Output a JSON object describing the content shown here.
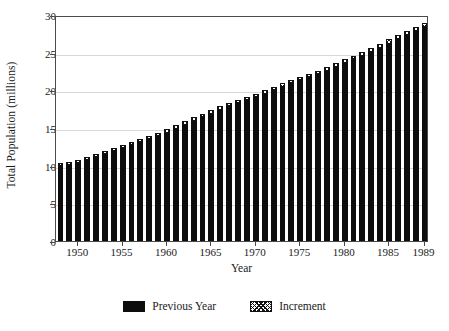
{
  "chart_data": {
    "type": "bar",
    "title": "",
    "subtitle": "",
    "xlabel": "Year",
    "ylabel": "Total Population (millions)",
    "xlim": [
      1947.5,
      1989.5
    ],
    "ylim": [
      0,
      30
    ],
    "yticks": [
      0,
      5,
      10,
      15,
      20,
      25,
      30
    ],
    "ytick_labels": [
      "0",
      "5",
      "10",
      "15",
      "20",
      "25",
      "30"
    ],
    "xticks": [
      1950,
      1955,
      1960,
      1965,
      1970,
      1975,
      1980,
      1985,
      1989
    ],
    "xtick_labels": [
      "1950",
      "1955",
      "1960",
      "1965",
      "1970",
      "1975",
      "1980",
      "1985",
      "1989"
    ],
    "grid": true,
    "grid_axis": "y",
    "stacked": true,
    "legend_position": "bottom",
    "legend": [
      "Previous Year",
      "Increment"
    ],
    "colors": {
      "previous_year": "#0d0d0d",
      "increment": "#ffffff",
      "increment_edge": "#111111",
      "grid": "#d8d8d8",
      "frame": "#4a4a4a",
      "background": "#ffffff"
    },
    "categories": [
      1948,
      1949,
      1950,
      1951,
      1952,
      1953,
      1954,
      1955,
      1956,
      1957,
      1958,
      1959,
      1960,
      1961,
      1962,
      1963,
      1964,
      1965,
      1966,
      1967,
      1968,
      1969,
      1970,
      1971,
      1972,
      1973,
      1974,
      1975,
      1976,
      1977,
      1978,
      1979,
      1980,
      1981,
      1982,
      1983,
      1984,
      1985,
      1986,
      1987,
      1988,
      1989
    ],
    "series": [
      {
        "name": "Previous Year",
        "values": [
          9.9,
          10.1,
          10.4,
          10.7,
          11.1,
          11.5,
          11.9,
          12.3,
          12.7,
          13.1,
          13.5,
          13.9,
          14.4,
          14.9,
          15.4,
          15.9,
          16.4,
          16.9,
          17.4,
          17.9,
          18.3,
          18.7,
          19.1,
          19.5,
          20.0,
          20.5,
          21.0,
          21.4,
          21.8,
          22.2,
          22.6,
          23.1,
          23.6,
          24.1,
          24.6,
          25.1,
          25.6,
          26.2,
          26.8,
          27.3,
          27.9,
          28.4
        ]
      },
      {
        "name": "Increment",
        "values": [
          0.2,
          0.3,
          0.3,
          0.4,
          0.4,
          0.4,
          0.4,
          0.4,
          0.4,
          0.4,
          0.4,
          0.5,
          0.5,
          0.5,
          0.5,
          0.5,
          0.5,
          0.5,
          0.5,
          0.4,
          0.4,
          0.4,
          0.4,
          0.5,
          0.5,
          0.5,
          0.4,
          0.4,
          0.4,
          0.4,
          0.5,
          0.5,
          0.5,
          0.5,
          0.5,
          0.5,
          0.6,
          0.6,
          0.5,
          0.6,
          0.5,
          0.6
        ]
      }
    ],
    "totals": [
      10.1,
      10.4,
      10.7,
      11.1,
      11.5,
      11.9,
      12.3,
      12.7,
      13.1,
      13.5,
      13.9,
      14.4,
      14.9,
      15.4,
      15.9,
      16.4,
      16.9,
      17.4,
      17.9,
      18.3,
      18.7,
      19.1,
      19.5,
      20.0,
      20.5,
      21.0,
      21.4,
      21.8,
      22.2,
      22.6,
      23.1,
      23.6,
      24.1,
      24.6,
      25.1,
      25.6,
      26.2,
      26.8,
      27.3,
      27.9,
      28.4,
      29.0
    ]
  },
  "legend": {
    "items": [
      {
        "label": "Previous Year",
        "swatch": "solid-black-swatch"
      },
      {
        "label": "Increment",
        "swatch": "crosshatch-swatch"
      }
    ]
  }
}
